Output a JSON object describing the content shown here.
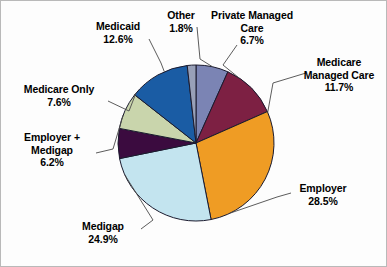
{
  "chart_data": {
    "type": "pie",
    "title": "",
    "subtitle": "",
    "xlabel": "",
    "ylabel": "",
    "grid": false,
    "legend_position": "callout-labels",
    "start_angle_deg": 0,
    "direction": "clockwise",
    "total_pct": 100.0,
    "categories": [
      "Private Managed Care",
      "Medicare Managed Care",
      "Employer",
      "Medigap",
      "Employer + Medigap",
      "Medicare Only",
      "Medicaid",
      "Other"
    ],
    "values": [
      6.7,
      11.7,
      28.5,
      24.9,
      6.2,
      7.6,
      12.6,
      1.8
    ],
    "value_labels": [
      "6.7%",
      "11.7%",
      "28.5%",
      "24.9%",
      "6.2%",
      "7.6%",
      "12.6%",
      "1.8%"
    ],
    "colors": [
      "#7b84b4",
      "#7d2043",
      "#ef9c24",
      "#c3e4ef",
      "#3b0b3f",
      "#c9d5ac",
      "#1a5ca4",
      "#98a0b8"
    ],
    "slices": [
      {
        "label": "Private Managed Care",
        "value": 6.7,
        "value_label": "6.7%",
        "color": "#7b84b4"
      },
      {
        "label": "Medicare Managed Care",
        "value": 11.7,
        "value_label": "11.7%",
        "color": "#7d2043"
      },
      {
        "label": "Employer",
        "value": 28.5,
        "value_label": "28.5%",
        "color": "#ef9c24"
      },
      {
        "label": "Medigap",
        "value": 24.9,
        "value_label": "24.9%",
        "color": "#c3e4ef"
      },
      {
        "label": "Employer + Medigap",
        "value": 6.2,
        "value_label": "6.2%",
        "color": "#3b0b3f"
      },
      {
        "label": "Medicare Only",
        "value": 7.6,
        "value_label": "7.6%",
        "color": "#c9d5ac"
      },
      {
        "label": "Medicaid",
        "value": 12.6,
        "value_label": "12.6%",
        "color": "#1a5ca4"
      },
      {
        "label": "Other",
        "value": 1.8,
        "value_label": "1.8%",
        "color": "#98a0b8"
      }
    ]
  },
  "labels": {
    "other": {
      "name": "Other",
      "pct": "1.8%"
    },
    "private_managed": {
      "name": "Private Managed\nCare",
      "name_line1": "Private Managed",
      "name_line2": "Care",
      "pct": "6.7%"
    },
    "medicare_managed": {
      "name_line1": "Medicare",
      "name_line2": "Managed Care",
      "pct": "11.7%"
    },
    "employer": {
      "name": "Employer",
      "pct": "28.5%"
    },
    "medigap": {
      "name": "Medigap",
      "pct": "24.9%"
    },
    "employer_medigap": {
      "name_line1": "Employer +",
      "name_line2": "Medigap",
      "pct": "6.2%"
    },
    "medicare_only": {
      "name": "Medicare Only",
      "pct": "7.6%"
    },
    "medicaid": {
      "name": "Medicaid",
      "pct": "12.6%"
    }
  },
  "style": {
    "pie_center_x": 195,
    "pie_center_y": 142,
    "pie_radius": 78,
    "slice_outline": "#1a1a2e",
    "leader_line_color": "#4a4a4a",
    "background": "#fdfdfd",
    "frame_border": "#b9b9b9",
    "text_color": "#000000"
  }
}
